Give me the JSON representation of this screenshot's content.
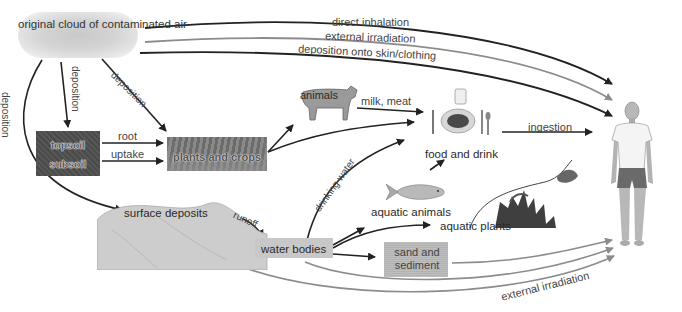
{
  "nodes": {
    "cloud": "original cloud of contaminated air",
    "topsoil": "topsoil",
    "subsoil": "subsoil",
    "plants": "plants and crops",
    "animals": "animals",
    "food": "food and drink",
    "surface_deposits": "surface deposits",
    "water_bodies": "water bodies",
    "aquatic_animals": "aquatic animals",
    "aquatic_plants": "aquatic plants",
    "sand": "sand and sediment",
    "human": "human"
  },
  "edges": {
    "direct_inhalation": "direct inhalation",
    "external_irradiation_top": "external irradiation",
    "deposition_skin": "deposition onto skin/clothing",
    "deposition_left": "deposition",
    "deposition_middle": "deposition",
    "deposition_right": "deposition",
    "root": "root",
    "uptake": "uptake",
    "milk_meat": "milk, meat",
    "ingestion": "ingestion",
    "drinking_water": "drinking water",
    "runoff": "runoff",
    "external_irradiation_bottom": "external irradiation"
  },
  "colors": {
    "dark_arrow": "#222222",
    "gray_arrow": "#8c8c8c",
    "label_text": "#444444"
  }
}
